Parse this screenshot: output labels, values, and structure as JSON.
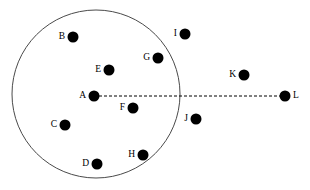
{
  "figure": {
    "type": "geometric-point-diagram",
    "width": 310,
    "height": 190,
    "background_color": "#ffffff"
  },
  "circle": {
    "name": "boundary-circle",
    "center_x": 96,
    "center_y": 94,
    "radius": 84,
    "stroke_color": "#4a4a4a",
    "stroke_width": 1,
    "fill": "none"
  },
  "radius_line": {
    "name": "dashed-radius-line",
    "from_label": "A",
    "to_label": "L",
    "x1": 99,
    "y1": 96,
    "x2": 280,
    "y2": 96,
    "style": "dashed",
    "color": "#000000"
  },
  "points": [
    {
      "label": "A",
      "x": 94,
      "y": 96,
      "r": 5.5,
      "label_x": 86,
      "label_y": 96,
      "label_side": "left",
      "inside_circle": true,
      "color": "#000000"
    },
    {
      "label": "B",
      "x": 73,
      "y": 37,
      "r": 5.5,
      "label_x": 65,
      "label_y": 37,
      "label_side": "left",
      "inside_circle": true,
      "color": "#000000"
    },
    {
      "label": "C",
      "x": 65,
      "y": 125,
      "r": 5.5,
      "label_x": 57,
      "label_y": 125,
      "label_side": "left",
      "inside_circle": true,
      "color": "#000000"
    },
    {
      "label": "D",
      "x": 97,
      "y": 164,
      "r": 5.5,
      "label_x": 89,
      "label_y": 164,
      "label_side": "left",
      "inside_circle": true,
      "color": "#000000"
    },
    {
      "label": "E",
      "x": 109,
      "y": 70,
      "r": 5.5,
      "label_x": 101,
      "label_y": 70,
      "label_side": "left",
      "inside_circle": true,
      "color": "#000000"
    },
    {
      "label": "F",
      "x": 133,
      "y": 108,
      "r": 5.5,
      "label_x": 125,
      "label_y": 108,
      "label_side": "left",
      "inside_circle": true,
      "color": "#000000"
    },
    {
      "label": "G",
      "x": 158,
      "y": 58,
      "r": 5.5,
      "label_x": 150,
      "label_y": 58,
      "label_side": "left",
      "inside_circle": true,
      "color": "#000000"
    },
    {
      "label": "H",
      "x": 143,
      "y": 155,
      "r": 5.5,
      "label_x": 135,
      "label_y": 155,
      "label_side": "left",
      "inside_circle": true,
      "color": "#000000"
    },
    {
      "label": "I",
      "x": 185,
      "y": 34,
      "r": 5.5,
      "label_x": 177,
      "label_y": 34,
      "label_side": "left",
      "inside_circle": false,
      "color": "#000000"
    },
    {
      "label": "J",
      "x": 196,
      "y": 119,
      "r": 5.5,
      "label_x": 188,
      "label_y": 119,
      "label_side": "left",
      "inside_circle": false,
      "color": "#000000"
    },
    {
      "label": "K",
      "x": 244,
      "y": 75,
      "r": 5.5,
      "label_x": 236,
      "label_y": 75,
      "label_side": "left",
      "inside_circle": false,
      "color": "#000000"
    },
    {
      "label": "L",
      "x": 285,
      "y": 96,
      "r": 5.5,
      "label_x": 293,
      "label_y": 96,
      "label_side": "right",
      "inside_circle": false,
      "color": "#000000"
    }
  ]
}
